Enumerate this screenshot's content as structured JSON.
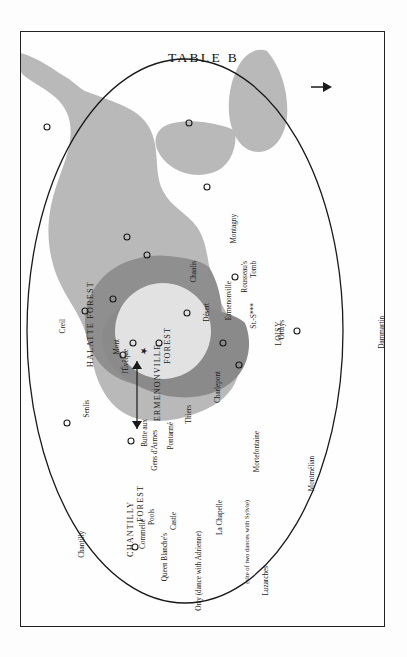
{
  "page": {
    "title": "TABLE B",
    "orientation": "rotated-90-landscape-plate"
  },
  "colors": {
    "paper": "#fdfdfd",
    "frame_border": "#222222",
    "forest_light": "#b7b7b7",
    "forest_mid": "#949494",
    "forest_dark": "#8a8a8a",
    "loisy_halo": "#e0e0e0",
    "ellipse_stroke": "#1a1a1a",
    "text": "#181818"
  },
  "map": {
    "region_labels": [
      {
        "name": "halatte-forest",
        "text": "HALATTE FOREST"
      },
      {
        "name": "chantilly-forest",
        "text": "CHANTILLY FOREST"
      },
      {
        "name": "ermenonville-forest",
        "text": "ERMENONVILLE FOREST"
      }
    ],
    "off_map_pointers": [
      {
        "name": "creil-pointer",
        "text": "Creil",
        "glyph": "↑"
      }
    ],
    "places": [
      {
        "name": "place-creil",
        "text": "Creil"
      },
      {
        "name": "place-senlis",
        "text": "Senlis"
      },
      {
        "name": "place-chantilly",
        "text": "Chantilly"
      },
      {
        "name": "place-mont-leveque",
        "text": "Mont l'Évêque"
      },
      {
        "name": "place-chaalis",
        "text": "Chaalis"
      },
      {
        "name": "place-desert",
        "text": "Désert"
      },
      {
        "name": "place-montagny",
        "text": "Montagny"
      },
      {
        "name": "place-ermenonville",
        "text": "Ermenonville"
      },
      {
        "name": "place-rousseaus-tomb",
        "text": "Rousseau's Tomb"
      },
      {
        "name": "place-st-s",
        "text": "St.-S***"
      },
      {
        "name": "place-loisy",
        "text": "LOISY"
      },
      {
        "name": "place-orthys",
        "text": "Orthys"
      },
      {
        "name": "place-dammartin",
        "text": "Dammartin"
      },
      {
        "name": "place-butte-aux-gens-darmes",
        "text": "Butte aux\nGens d'Armes"
      },
      {
        "name": "place-pontarme",
        "text": "Pontarmé"
      },
      {
        "name": "place-thiers",
        "text": "Thiers"
      },
      {
        "name": "place-charlepont",
        "text": "Charlepont"
      },
      {
        "name": "place-commelle-pools",
        "text": "Commelle\nPools"
      },
      {
        "name": "place-queen-blanches-castle",
        "text": "Queen Blanche's\nCastle"
      },
      {
        "name": "place-orry",
        "text": "Orry (dance with Adrienne)"
      },
      {
        "name": "place-la-chapelle",
        "text": "La Chapelle"
      },
      {
        "name": "place-mortefontaine",
        "text": "Mortefontaine"
      },
      {
        "name": "place-montmelian",
        "text": "Montmélian"
      },
      {
        "name": "place-luzarches",
        "text": "Luzarches"
      }
    ],
    "annotations": [
      {
        "name": "sylvie-dance-note",
        "text": "(site of two dances with Sylvie)"
      }
    ],
    "label_groups": {
      "halatte_forest": "HALATTE FOREST",
      "chantilly_forest_l1": "CHANTILLY",
      "chantilly_forest_l2": "FOREST",
      "ermenonville_forest_l1": "ERMENONVILLE",
      "ermenonville_forest_l2": "FOREST",
      "creil": "Creil",
      "senlis": "Senlis",
      "chantilly": "Chantilly",
      "mont_leveque_l1": "Mont",
      "mont_leveque_l2": "l'Évêque",
      "chaalis": "Chaalis",
      "desert": "Désert",
      "montagny": "Montagny",
      "ermenonville": "Ermenonville",
      "rousseaus_tomb_l1": "Rousseau's",
      "rousseaus_tomb_l2": "Tomb",
      "st_s": "St.-S***",
      "loisy": "LOISY",
      "orthys": "Orthys",
      "dammartin": "Dammartin",
      "butte_l1": "Butte aux",
      "butte_l2": "Gens d'Armes",
      "pontarme": "Pontarmé",
      "thiers": "Thiers",
      "charlepont": "Charlepont",
      "commelle_l1": "Commelle",
      "commelle_l2": "Pools",
      "queen_blanche_l1": "Queen Blanche's",
      "queen_blanche_l2": "Castle",
      "orry": "Orry (dance with Adrienne)",
      "la_chapelle": "La Chapelle",
      "sylvie_note": "(site of two dances with Sylvie)",
      "mortefontaine": "Mortefontaine",
      "montmelian": "Montmélian",
      "luzarches": "Luzarches"
    }
  }
}
